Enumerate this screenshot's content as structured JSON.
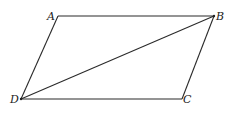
{
  "figure": {
    "type": "parallelogram-with-diagonal",
    "vertices": {
      "A": {
        "label": "A"
      },
      "B": {
        "label": "B"
      },
      "C": {
        "label": "C"
      },
      "D": {
        "label": "D"
      }
    },
    "edges": [
      {
        "name": "AB",
        "from": "A",
        "to": "B"
      },
      {
        "name": "BC",
        "from": "B",
        "to": "C"
      },
      {
        "name": "CD",
        "from": "C",
        "to": "D"
      },
      {
        "name": "DA",
        "from": "D",
        "to": "A"
      },
      {
        "name": "DB",
        "from": "D",
        "to": "B",
        "kind": "diagonal"
      }
    ]
  }
}
